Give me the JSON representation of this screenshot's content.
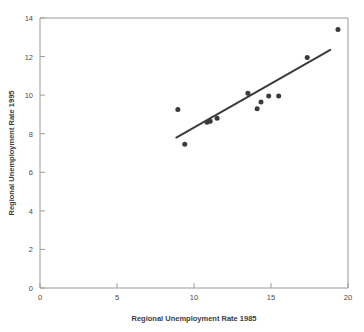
{
  "chart_data": {
    "type": "scatter",
    "title": "",
    "subtitle": "",
    "xlabel": "Regional Unemployment Rate 1985",
    "ylabel": "Regional Unemployment Rate 1995",
    "xlim": [
      0,
      20
    ],
    "ylim": [
      0,
      14
    ],
    "xticks": [
      0,
      5,
      10,
      15,
      20
    ],
    "xtick_labels": [
      "0",
      "5",
      "10",
      "15",
      "20"
    ],
    "yticks": [
      0,
      2,
      4,
      6,
      8,
      10,
      12,
      14
    ],
    "ytick_labels": [
      "0",
      "2",
      "4",
      "6",
      "8",
      "10",
      "12",
      "14"
    ],
    "grid": false,
    "legend": null,
    "legend_position": "none",
    "marker": "filled-circle",
    "marker_color": "#3a3a3a",
    "points": [
      {
        "x": 8.95,
        "y": 9.25
      },
      {
        "x": 9.4,
        "y": 7.45
      },
      {
        "x": 10.85,
        "y": 8.6
      },
      {
        "x": 11.05,
        "y": 8.65
      },
      {
        "x": 11.5,
        "y": 8.8
      },
      {
        "x": 13.5,
        "y": 10.1
      },
      {
        "x": 14.1,
        "y": 9.3
      },
      {
        "x": 14.35,
        "y": 9.65
      },
      {
        "x": 14.85,
        "y": 9.95
      },
      {
        "x": 15.5,
        "y": 9.95
      },
      {
        "x": 17.35,
        "y": 11.95
      },
      {
        "x": 19.35,
        "y": 13.4
      }
    ],
    "trend_line": {
      "type": "linear-fit",
      "color": "#3a3a3a",
      "x_start": 8.85,
      "y_start": 7.8,
      "x_end": 18.85,
      "y_end": 12.35
    }
  },
  "axes": {
    "x_axis_name": "x-axis",
    "y_axis_name": "y-axis"
  }
}
